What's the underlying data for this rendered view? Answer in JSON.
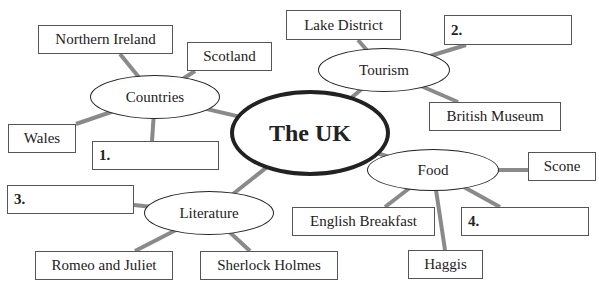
{
  "center": {
    "label": "The UK"
  },
  "topics": {
    "countries": {
      "label": "Countries",
      "items": [
        "Northern Ireland",
        "Scotland",
        "Wales",
        "1."
      ]
    },
    "tourism": {
      "label": "Tourism",
      "items": [
        "Lake District",
        "2.",
        "British Museum"
      ]
    },
    "food": {
      "label": "Food",
      "items": [
        "Scone",
        "English Breakfast",
        "Haggis",
        "4."
      ]
    },
    "literature": {
      "label": "Literature",
      "items": [
        "3.",
        "Romeo and Juliet",
        "Sherlock Holmes"
      ]
    }
  },
  "colors": {
    "line": "#8a8a8a",
    "border": "#222222",
    "box_border": "#555555"
  }
}
